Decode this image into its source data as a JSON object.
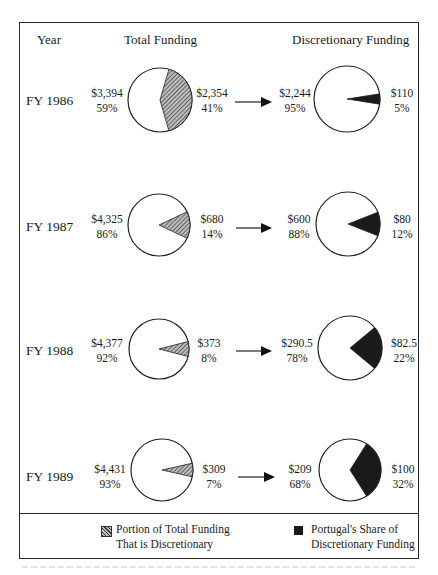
{
  "headers": {
    "year": "Year",
    "total": "Total Funding",
    "discretionary": "Discretionary Funding"
  },
  "colors": {
    "frame": "#2a2a2a",
    "hatch": "#555555",
    "portugal_share": "#1a1a1a",
    "pie_fill": "#ffffff"
  },
  "rows": [
    {
      "year": "FY 1986",
      "total_left_amount": "$3,394",
      "total_left_pct": "59%",
      "total_right_amount": "$2,354",
      "total_right_pct": "41%",
      "disc_left_amount": "$2,244",
      "disc_left_pct": "95%",
      "disc_right_amount": "$110",
      "disc_right_pct": "5%"
    },
    {
      "year": "FY 1987",
      "total_left_amount": "$4,325",
      "total_left_pct": "86%",
      "total_right_amount": "$680",
      "total_right_pct": "14%",
      "disc_left_amount": "$600",
      "disc_left_pct": "88%",
      "disc_right_amount": "$80",
      "disc_right_pct": "12%"
    },
    {
      "year": "FY 1988",
      "total_left_amount": "$4,377",
      "total_left_pct": "92%",
      "total_right_amount": "$373",
      "total_right_pct": "8%",
      "disc_left_amount": "$290.5",
      "disc_left_pct": "78%",
      "disc_right_amount": "$82.5",
      "disc_right_pct": "22%"
    },
    {
      "year": "FY 1989",
      "total_left_amount": "$4,431",
      "total_left_pct": "93%",
      "total_right_amount": "$309",
      "total_right_pct": "7%",
      "disc_left_amount": "$209",
      "disc_left_pct": "68%",
      "disc_right_amount": "$100",
      "disc_right_pct": "32%"
    }
  ],
  "legend": {
    "hatched_line1": "Portion of Total Funding",
    "hatched_line2": "That is Discretionary",
    "solid_line1": "Portugal's Share of",
    "solid_line2": "Discretionary Funding"
  },
  "chart_data": [
    {
      "type": "pie",
      "title": "Total Funding (by fiscal year)",
      "categories": [
        "FY 1986",
        "FY 1987",
        "FY 1988",
        "FY 1989"
      ],
      "series": [
        {
          "name": "Non-discretionary",
          "values": [
            3394,
            4325,
            4377,
            4431
          ],
          "percent": [
            59,
            86,
            92,
            93
          ]
        },
        {
          "name": "Portion of Total Funding That is Discretionary",
          "values": [
            2354,
            680,
            373,
            309
          ],
          "percent": [
            41,
            14,
            8,
            7
          ]
        }
      ],
      "units": "$",
      "legend_position": "bottom"
    },
    {
      "type": "pie",
      "title": "Discretionary Funding (by fiscal year)",
      "categories": [
        "FY 1986",
        "FY 1987",
        "FY 1988",
        "FY 1989"
      ],
      "series": [
        {
          "name": "Other discretionary",
          "values": [
            2244,
            600,
            290.5,
            209
          ],
          "percent": [
            95,
            88,
            78,
            68
          ]
        },
        {
          "name": "Portugal's Share of Discretionary Funding",
          "values": [
            110,
            80,
            82.5,
            100
          ],
          "percent": [
            5,
            12,
            22,
            32
          ]
        }
      ],
      "units": "$",
      "legend_position": "bottom"
    }
  ]
}
